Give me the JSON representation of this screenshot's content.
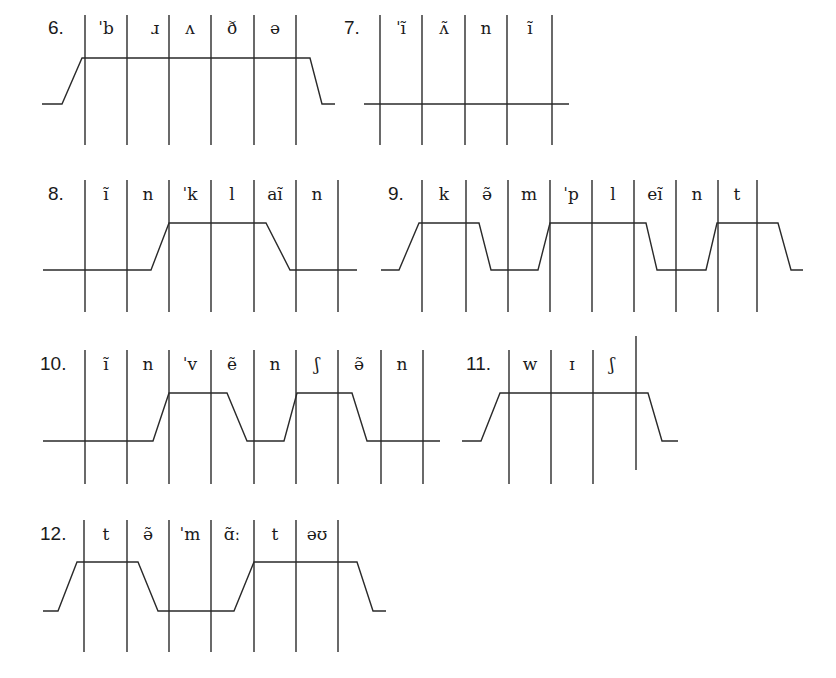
{
  "diagrams": [
    {
      "number": "6.",
      "num_pos": [
        48,
        34
      ],
      "segments": [
        {
          "label": "ˈb",
          "x": 106
        },
        {
          "label": "ɹ",
          "x": 155
        },
        {
          "label": "ʌ",
          "x": 190
        },
        {
          "label": "ð",
          "x": 232
        },
        {
          "label": "ə",
          "x": 275
        }
      ],
      "verticals": {
        "x": [
          85,
          127,
          169,
          211,
          254,
          296
        ],
        "y1": 15,
        "y2": 145
      },
      "contour": [
        [
          42,
          104
        ],
        [
          62,
          104
        ],
        [
          82,
          58
        ],
        [
          310,
          58
        ],
        [
          322,
          104
        ],
        [
          335,
          104
        ]
      ]
    },
    {
      "number": "7.",
      "num_pos": [
        344,
        34
      ],
      "segments": [
        {
          "label": "ˈĩ",
          "x": 401
        },
        {
          "label": "ʌ̃",
          "x": 444
        },
        {
          "label": "n",
          "x": 486
        },
        {
          "label": "ĩ",
          "x": 530
        }
      ],
      "verticals": {
        "x": [
          380,
          422,
          465,
          507,
          552
        ],
        "y1": 15,
        "y2": 145
      },
      "contour": [
        [
          364,
          104
        ],
        [
          569,
          104
        ]
      ]
    },
    {
      "number": "8.",
      "num_pos": [
        48,
        200
      ],
      "segments": [
        {
          "label": "ĩ",
          "x": 106
        },
        {
          "label": "n",
          "x": 148
        },
        {
          "label": "ˈk",
          "x": 190
        },
        {
          "label": "l",
          "x": 232
        },
        {
          "label": "aĩ",
          "x": 275
        },
        {
          "label": "n",
          "x": 317
        }
      ],
      "verticals": {
        "x": [
          85,
          127,
          169,
          211,
          254,
          296,
          338
        ],
        "y1": 180,
        "y2": 312
      },
      "contour": [
        [
          43,
          270
        ],
        [
          151,
          270
        ],
        [
          169,
          223
        ],
        [
          266,
          223
        ],
        [
          290,
          270
        ],
        [
          357,
          270
        ]
      ]
    },
    {
      "number": "9.",
      "num_pos": [
        388,
        200
      ],
      "segments": [
        {
          "label": "k",
          "x": 444
        },
        {
          "label": "ə̃",
          "x": 487
        },
        {
          "label": "m",
          "x": 529
        },
        {
          "label": "ˈp",
          "x": 571
        },
        {
          "label": "l",
          "x": 613
        },
        {
          "label": "eĩ",
          "x": 655
        },
        {
          "label": "n",
          "x": 697
        },
        {
          "label": "t",
          "x": 737
        }
      ],
      "verticals": {
        "x": [
          422,
          466,
          508,
          550,
          592,
          634,
          676,
          718,
          757
        ],
        "y1": 180,
        "y2": 312
      },
      "contour": [
        [
          381,
          270
        ],
        [
          399,
          270
        ],
        [
          419,
          223
        ],
        [
          479,
          223
        ],
        [
          491,
          270
        ],
        [
          538,
          270
        ],
        [
          550,
          223
        ],
        [
          646,
          223
        ],
        [
          657,
          270
        ],
        [
          706,
          270
        ],
        [
          717,
          223
        ],
        [
          778,
          223
        ],
        [
          791,
          270
        ],
        [
          803,
          270
        ]
      ]
    },
    {
      "number": "10.",
      "num_pos": [
        40,
        370
      ],
      "segments": [
        {
          "label": "ĩ",
          "x": 106
        },
        {
          "label": "n",
          "x": 148
        },
        {
          "label": "ˈv",
          "x": 190
        },
        {
          "label": "ẽ",
          "x": 232
        },
        {
          "label": "n",
          "x": 275
        },
        {
          "label": "ʃ",
          "x": 317
        },
        {
          "label": "ə̃",
          "x": 359
        },
        {
          "label": "n",
          "x": 402
        }
      ],
      "verticals": {
        "x": [
          85,
          127,
          169,
          211,
          254,
          296,
          338,
          381,
          423
        ],
        "y1": 350,
        "y2": 484
      },
      "contour": [
        [
          43,
          441
        ],
        [
          153,
          441
        ],
        [
          169,
          393
        ],
        [
          227,
          393
        ],
        [
          247,
          441
        ],
        [
          284,
          441
        ],
        [
          297,
          393
        ],
        [
          352,
          393
        ],
        [
          367,
          441
        ],
        [
          440,
          441
        ]
      ]
    },
    {
      "number": "11.",
      "num_pos": [
        466,
        370
      ],
      "segments": [
        {
          "label": "w",
          "x": 530
        },
        {
          "label": "ɪ",
          "x": 572
        },
        {
          "label": "ʃ",
          "x": 612
        }
      ],
      "verticals": {
        "x": [
          509,
          551,
          593
        ],
        "y1": 350,
        "y2": 484
      },
      "extra_vertical": {
        "x": 636,
        "y1": 336,
        "y2": 470
      },
      "contour": [
        [
          462,
          441
        ],
        [
          481,
          441
        ],
        [
          500,
          393
        ],
        [
          648,
          393
        ],
        [
          662,
          441
        ],
        [
          678,
          441
        ]
      ]
    },
    {
      "number": "12.",
      "num_pos": [
        40,
        540
      ],
      "segments": [
        {
          "label": "t",
          "x": 106
        },
        {
          "label": "ə̃",
          "x": 148
        },
        {
          "label": "ˈm",
          "x": 190
        },
        {
          "label": "ɑ̃ː",
          "x": 232
        },
        {
          "label": "t",
          "x": 275
        },
        {
          "label": "əʊ",
          "x": 317
        }
      ],
      "verticals": {
        "x": [
          84,
          127,
          169,
          211,
          254,
          296,
          338
        ],
        "y1": 520,
        "y2": 652
      },
      "contour": [
        [
          43,
          611
        ],
        [
          58,
          611
        ],
        [
          77,
          562
        ],
        [
          138,
          562
        ],
        [
          158,
          611
        ],
        [
          234,
          611
        ],
        [
          254,
          562
        ],
        [
          357,
          562
        ],
        [
          373,
          611
        ],
        [
          386,
          611
        ]
      ]
    }
  ]
}
